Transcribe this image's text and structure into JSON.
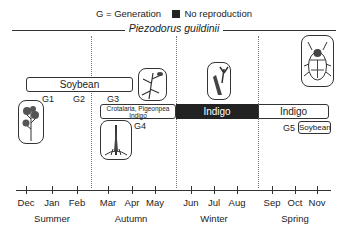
{
  "legend": {
    "generation_text": "G = Generation",
    "no_reproduction_text": "No reproduction",
    "no_reproduction_color": "#222222"
  },
  "title": "Piezodorus guildinii",
  "bars": [
    {
      "label": "Soybean",
      "style": "outline"
    },
    {
      "label": "Crotalaria, Pigeonpea\nIndigo",
      "line1": "Crotalaria, Pigeonpea",
      "line2": "Indigo",
      "style": "outline"
    },
    {
      "label": "Indigo",
      "style": "filled-no-reproduction"
    },
    {
      "label": "Indigo",
      "style": "outline"
    },
    {
      "label": "Soybean",
      "style": "outline"
    }
  ],
  "generations": [
    "G1",
    "G2",
    "G3",
    "G4",
    "G5"
  ],
  "illustrations": [
    {
      "name": "soybean-plant-icon"
    },
    {
      "name": "crotalaria-plant-icon"
    },
    {
      "name": "pigeonpea-plant-icon"
    },
    {
      "name": "indigo-plant-icon"
    },
    {
      "name": "stink-bug-icon"
    }
  ],
  "axis": {
    "months": [
      "Dec",
      "Jan",
      "Feb",
      "Mar",
      "Apr",
      "May",
      "Jun",
      "Jul",
      "Aug",
      "Sep",
      "Oct",
      "Nov"
    ],
    "seasons": [
      "Summer",
      "Autumn",
      "Winter",
      "Spring"
    ]
  }
}
